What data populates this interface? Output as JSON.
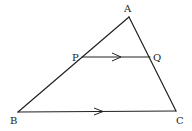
{
  "diagram": {
    "type": "triangle-with-parallel-segment",
    "colors": {
      "stroke": "#222222",
      "background": "#ffffff"
    },
    "points": {
      "A": {
        "label": "A",
        "x": 129,
        "y": 17,
        "lx": 124,
        "ly": 12
      },
      "B": {
        "label": "B",
        "x": 18,
        "y": 112,
        "lx": 10,
        "ly": 124
      },
      "C": {
        "label": "C",
        "x": 176,
        "y": 111,
        "lx": 176,
        "ly": 124
      },
      "P": {
        "label": "P",
        "x": 82,
        "y": 57,
        "lx": 72,
        "ly": 61
      },
      "Q": {
        "label": "Q",
        "x": 150,
        "y": 57,
        "lx": 153,
        "ly": 61
      }
    },
    "segments": [
      {
        "from": "A",
        "to": "B"
      },
      {
        "from": "A",
        "to": "C"
      },
      {
        "from": "B",
        "to": "C",
        "parallel_marker": true
      },
      {
        "from": "P",
        "to": "Q",
        "parallel_marker": true
      }
    ],
    "relation": "PQ ∥ BC"
  }
}
